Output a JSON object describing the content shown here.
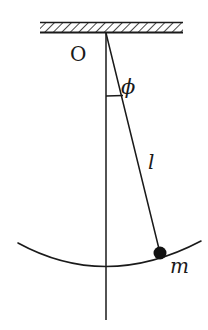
{
  "figure": {
    "background_color": "#ffffff",
    "ink_color": "#1a1a1a",
    "width": 208,
    "height": 330
  },
  "labels": {
    "pivot": "O",
    "angle": "ϕ",
    "length": "l",
    "mass": "m"
  },
  "geometry": {
    "ceiling": {
      "x_start": 40,
      "x_end": 183,
      "y_top": 23,
      "y_bottom": 32,
      "hatch_angle_deg": 45,
      "hatch_spacing": 6
    },
    "pivot_point": {
      "x": 106,
      "y": 32
    },
    "bob": {
      "x": 160,
      "y": 253,
      "radius": 6.5,
      "fill": "#111111"
    },
    "vertical_line": {
      "x": 106,
      "y_start": 32,
      "y_end": 320
    },
    "string": {
      "x1": 106,
      "y1": 32,
      "x2": 160,
      "y2": 253
    },
    "angle_tick": {
      "x1": 106,
      "y1": 96,
      "x2": 123,
      "y2": 96
    },
    "swing_arc": {
      "x_start": 18,
      "y_start": 243,
      "x_end": 201,
      "y_end": 241,
      "lowest_x": 106,
      "lowest_y": 266
    }
  }
}
